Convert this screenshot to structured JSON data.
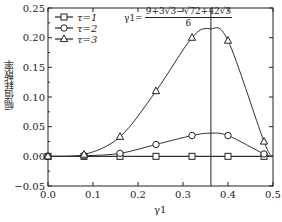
{
  "chart_data": {
    "type": "line",
    "title": "",
    "xlabel": "γ1",
    "ylabel": "幅值耗散率",
    "xlim": [
      0.0,
      0.5
    ],
    "ylim": [
      -0.05,
      0.25
    ],
    "xticks": [
      "0.0",
      "0.1",
      "0.2",
      "0.3",
      "0.4",
      "0.5"
    ],
    "yticks": [
      "0.25",
      "0.20",
      "0.15",
      "0.10",
      "0.05",
      "0.00",
      "−0.05"
    ],
    "grid": false,
    "legend_position": "upper-left",
    "x": [
      0.0,
      0.08,
      0.16,
      0.24,
      0.32,
      0.4,
      0.48
    ],
    "series": [
      {
        "name": "τ=1",
        "marker": "square",
        "values": [
          0.0,
          0.0,
          0.0,
          0.0,
          0.0,
          0.0,
          0.0
        ]
      },
      {
        "name": "τ=2",
        "marker": "circle",
        "values": [
          0.0,
          0.001,
          0.005,
          0.02,
          0.035,
          0.035,
          0.004
        ]
      },
      {
        "name": "τ=3",
        "marker": "triangle",
        "values": [
          0.0,
          0.003,
          0.033,
          0.11,
          0.2,
          0.195,
          0.025
        ]
      }
    ],
    "annotations": [
      {
        "type": "vline",
        "x": 0.362,
        "text": "γ1 = (9+3√3−√(72+42√3))/6"
      }
    ]
  },
  "labels": {
    "xlabel": "γ1",
    "ylabel": "幅值耗散率",
    "formula_lhs": "γ1=",
    "formula_num": "9+3√3−√72+42√3",
    "formula_den": "6",
    "legend": [
      "τ=1",
      "τ=2",
      "τ=3"
    ],
    "xticks": [
      "0.0",
      "0.1",
      "0.2",
      "0.3",
      "0.4",
      "0.5"
    ],
    "yticks": [
      "0.25",
      "0.20",
      "0.15",
      "0.10",
      "0.05",
      "0.00",
      "−0.05"
    ]
  }
}
